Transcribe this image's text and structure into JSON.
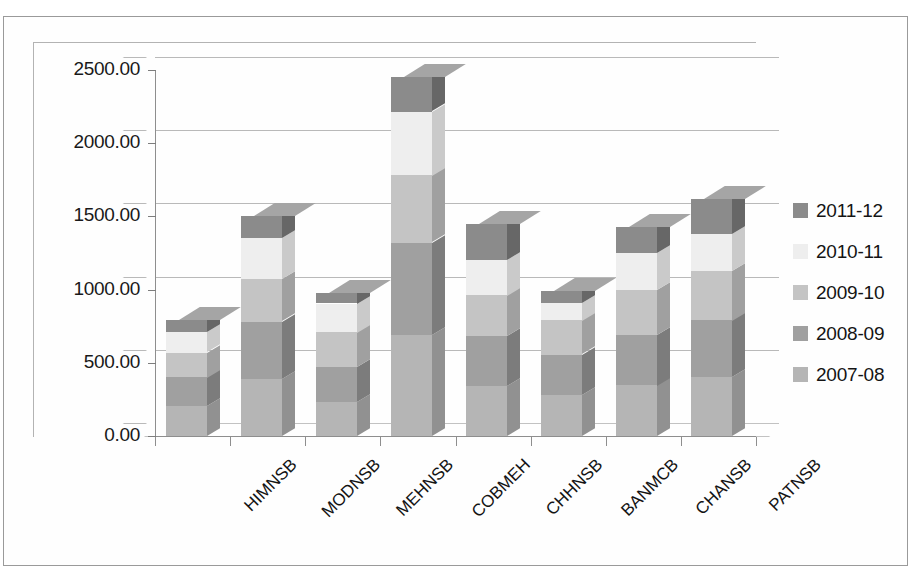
{
  "chart_data": {
    "type": "bar",
    "subtype": "stacked-column-3d",
    "title": "",
    "xlabel": "",
    "ylabel": "",
    "ylim": [
      0,
      2500
    ],
    "ytick_labels": [
      "0.00",
      "500.00",
      "1000.00",
      "1500.00",
      "2000.00",
      "2500.00"
    ],
    "ytick_values": [
      0,
      500,
      1000,
      1500,
      2000,
      2500
    ],
    "grid": true,
    "legend_position": "right",
    "categories": [
      "HIMNSB",
      "MODNSB",
      "MEHNSB",
      "COBMEH",
      "CHHNSB",
      "BANMCB",
      "CHANSB",
      "PATNSB"
    ],
    "series": [
      {
        "name": "2007-08",
        "color": "#b5b5b5",
        "values": [
          205,
          390,
          230,
          690,
          340,
          280,
          345,
          400
        ]
      },
      {
        "name": "2008-09",
        "color": "#a0a0a0",
        "values": [
          195,
          390,
          240,
          630,
          340,
          275,
          345,
          390
        ]
      },
      {
        "name": "2009-10",
        "color": "#c4c4c4",
        "values": [
          170,
          290,
          240,
          460,
          280,
          235,
          310,
          340
        ]
      },
      {
        "name": "2010-11",
        "color": "#eeeeee",
        "values": [
          140,
          280,
          195,
          435,
          245,
          120,
          250,
          250
        ]
      },
      {
        "name": "2011-12",
        "color": "#8b8b8b",
        "values": [
          85,
          150,
          75,
          235,
          245,
          80,
          180,
          240
        ]
      }
    ],
    "totals": [
      795,
      1500,
      980,
      2450,
      1450,
      990,
      1430,
      1620
    ]
  },
  "legend": {
    "items": [
      {
        "label": "2011-12",
        "color": "#8b8b8b"
      },
      {
        "label": "2010-11",
        "color": "#eeeeee"
      },
      {
        "label": "2009-10",
        "color": "#c4c4c4"
      },
      {
        "label": "2008-09",
        "color": "#a0a0a0"
      },
      {
        "label": "2007-08",
        "color": "#b5b5b5"
      }
    ]
  },
  "page": {
    "title_fragment": ""
  }
}
